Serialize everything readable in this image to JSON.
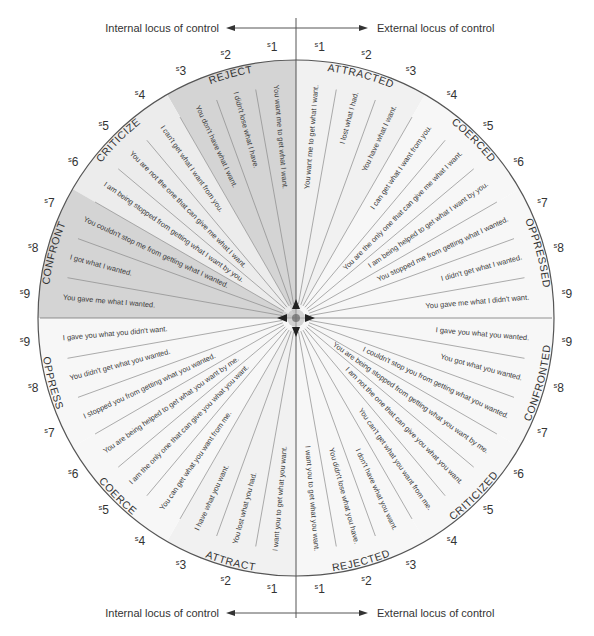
{
  "axes": {
    "top_left": "Internal locus of control",
    "top_right": "External locus of control",
    "bottom_left": "Internal locus of control",
    "bottom_right": "External locus of control"
  },
  "colors": {
    "shade_dark": "#d4d4d4",
    "shade_light": "#ececec",
    "base": "#f7f7f7",
    "line": "#555555",
    "spoke": "#8a8a8a",
    "text": "#333333"
  },
  "geometry": {
    "cx": 296,
    "cy": 318,
    "r": 258
  },
  "step_prefix": "s",
  "quadrants": [
    {
      "id": "top-left",
      "groups": [
        {
          "label": "REJECT",
          "sentences": [
            "You want me to get what I want.",
            "I didn't lose what I have.",
            "You don't have what I want."
          ]
        },
        {
          "label": "CRITICIZE",
          "sentences": [
            "I can't get what I want from you.",
            "You are not the one that can give me what I want.",
            "I am being stopped from getting what I want by you."
          ]
        },
        {
          "label": "CONFRONT",
          "sentences": [
            "You couldn't stop me from getting what I wanted.",
            "I got what I wanted.",
            "You gave me what I wanted."
          ]
        }
      ]
    },
    {
      "id": "top-right",
      "groups": [
        {
          "label": "ATTRACTED",
          "sentences": [
            "You want me to get what I want.",
            "I lost what I had.",
            "You have what I want."
          ]
        },
        {
          "label": "COERCED",
          "sentences": [
            "I can get what I want from you.",
            "You are the only one that can give me what I want.",
            "I am being helped to get what I want by you."
          ]
        },
        {
          "label": "OPPRESSED",
          "sentences": [
            "You stopped me from getting what I wanted.",
            "I didn't get what I wanted.",
            "You gave me what I didn't want."
          ]
        }
      ]
    },
    {
      "id": "bottom-right",
      "groups": [
        {
          "label": "REJECTED",
          "sentences": [
            "I want you to get what you want.",
            "You didn't lose what you have.",
            "I don't have what you want."
          ]
        },
        {
          "label": "CRITICIZED",
          "sentences": [
            "You can't get what you want from me.",
            "I am not the one that can give you what you want.",
            "You are being stopped from getting what you want by me."
          ]
        },
        {
          "label": "CONFRONTED",
          "sentences": [
            "I couldn't stop you from getting what you wanted.",
            "You got what you wanted.",
            "I gave you what you wanted."
          ]
        }
      ]
    },
    {
      "id": "bottom-left",
      "groups": [
        {
          "label": "ATTRACT",
          "sentences": [
            "I want you to get what you want.",
            "You lost what you had.",
            "I have what you want."
          ]
        },
        {
          "label": "COERCE",
          "sentences": [
            "You can get what you want from me.",
            "I am the only one that can give you what you want.",
            "You are being helped to get what you want by me."
          ]
        },
        {
          "label": "OPPRESS",
          "sentences": [
            "I stopped you from getting what you wanted.",
            "You didn't get what you wanted.",
            "I gave you what you didn't want."
          ]
        }
      ]
    }
  ]
}
